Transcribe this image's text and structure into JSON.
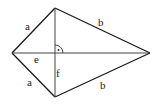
{
  "figure": {
    "shape": "kite",
    "labels": {
      "side_upper_left": "a",
      "side_lower_left": "a",
      "side_upper_right": "b",
      "side_lower_right": "b",
      "diagonal_horizontal": "e",
      "diagonal_vertical": "f"
    },
    "right_angle_marker": true
  }
}
